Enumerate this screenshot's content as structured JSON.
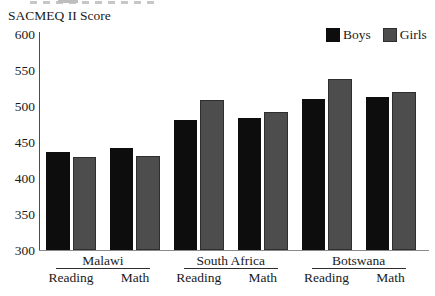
{
  "chart_data": {
    "type": "bar",
    "title": "SACMEQ II Score",
    "ylabel": "SACMEQ II Score",
    "xlabel": "",
    "ylim": [
      300,
      600
    ],
    "yticks": [
      600,
      550,
      500,
      450,
      400,
      350,
      300
    ],
    "grid": false,
    "legend_position": "top-right",
    "series": [
      {
        "name": "Boys",
        "color": "#0d0d0d"
      },
      {
        "name": "Girls",
        "color": "#4d4d4d"
      }
    ],
    "groups": [
      {
        "country": "Malawi",
        "subjects": [
          {
            "label": "Reading",
            "values": {
              "Boys": 436,
              "Girls": 429
            }
          },
          {
            "label": "Math",
            "values": {
              "Boys": 441,
              "Girls": 431
            }
          }
        ]
      },
      {
        "country": "South Africa",
        "subjects": [
          {
            "label": "Reading",
            "values": {
              "Boys": 481,
              "Girls": 508
            }
          },
          {
            "label": "Math",
            "values": {
              "Boys": 483,
              "Girls": 492
            }
          }
        ]
      },
      {
        "country": "Botswana",
        "subjects": [
          {
            "label": "Reading",
            "values": {
              "Boys": 510,
              "Girls": 538
            }
          },
          {
            "label": "Math",
            "values": {
              "Boys": 512,
              "Girls": 520
            }
          }
        ]
      }
    ]
  }
}
